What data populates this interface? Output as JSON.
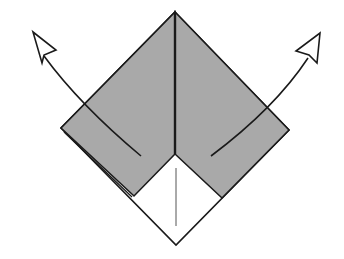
{
  "diagram": {
    "type": "origami-fold-step",
    "colors": {
      "paper_colored": "#a9a9a9",
      "paper_white": "#ffffff",
      "line": "#1a1a1a",
      "background": "#ffffff"
    },
    "arrows": [
      {
        "name": "unfold-left",
        "direction": "up-left"
      },
      {
        "name": "unfold-right",
        "direction": "up-right"
      }
    ]
  }
}
